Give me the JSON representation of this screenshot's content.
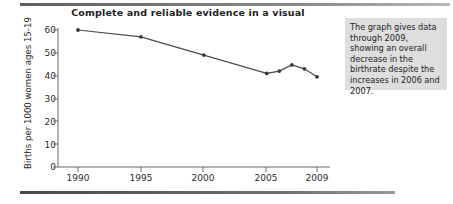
{
  "figure": {
    "title": "Complete and reliable evidence in a visual",
    "annotation": "The graph gives data through 2009, showing an overall decrease in the birthrate despite the increases in 2006 and 2007."
  },
  "chart_data": {
    "type": "line",
    "title": "Complete and reliable evidence in a visual",
    "xlabel": "",
    "ylabel": "Births per 1000 women ages 15-19",
    "x": [
      1990,
      1995,
      2000,
      2005,
      2006,
      2007,
      2008,
      2009
    ],
    "values": [
      60,
      57,
      49,
      41,
      42,
      44.7,
      43,
      39.5
    ],
    "series": [
      {
        "name": "Birthrate",
        "values": [
          60,
          57,
          49,
          41,
          42,
          44.7,
          43,
          39.5
        ]
      }
    ],
    "xlim": [
      1988.5,
      2010.5
    ],
    "ylim": [
      0,
      62
    ],
    "xticks": [
      1990,
      1995,
      2000,
      2005,
      2009
    ],
    "xticklabels": [
      "1990",
      "1995",
      "2000",
      "2005",
      "2009"
    ],
    "yticks": [
      0,
      10,
      20,
      30,
      40,
      50,
      60
    ],
    "yticklabels": [
      "0",
      "10",
      "20",
      "30",
      "40",
      "50",
      "60"
    ],
    "grid": false,
    "legend": "none",
    "marker": "circle",
    "line_color": "#4a4a4a",
    "marker_color": "#3a3a3a",
    "axis_color": "#6b6b6b",
    "annotations": [
      {
        "text": "The graph gives data through 2009, showing an overall decrease in the birthrate despite the increases in 2006 and 2007.",
        "position": "right"
      }
    ]
  }
}
